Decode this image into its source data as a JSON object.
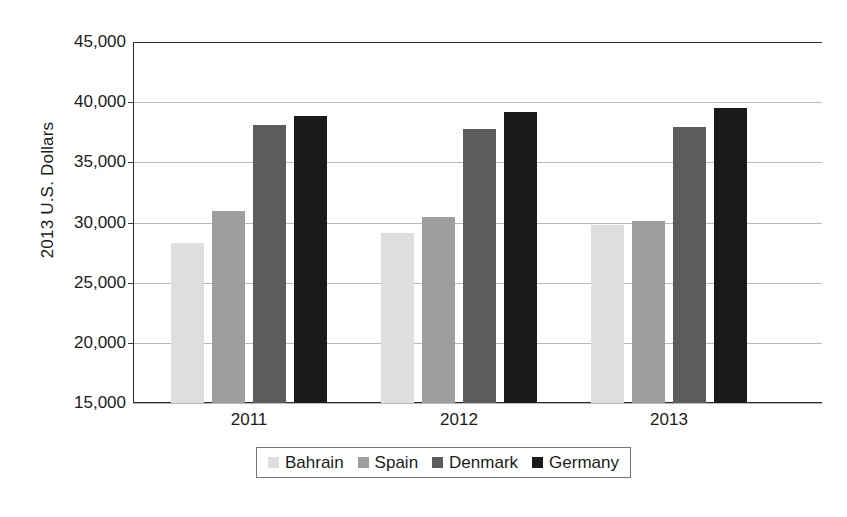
{
  "chart_data": {
    "type": "bar",
    "title": "",
    "xlabel": "",
    "ylabel": "2013 U.S. Dollars",
    "categories": [
      "2011",
      "2012",
      "2013"
    ],
    "series": [
      {
        "name": "Bahrain",
        "color": "#dedede",
        "values": [
          28300,
          29100,
          29800
        ]
      },
      {
        "name": "Spain",
        "color": "#9e9e9e",
        "values": [
          30950,
          30450,
          30100
        ]
      },
      {
        "name": "Denmark",
        "color": "#5c5c5c",
        "values": [
          38100,
          37800,
          37900
        ]
      },
      {
        "name": "Germany",
        "color": "#1a1a1a",
        "values": [
          38850,
          39200,
          39550
        ]
      }
    ],
    "ylim": [
      15000,
      45000
    ],
    "ytick_values": [
      45000,
      40000,
      35000,
      30000,
      25000,
      20000,
      15000
    ],
    "ytick_labels": [
      "45,000",
      "40,000",
      "35,000",
      "30,000",
      "25,000",
      "20,000",
      "15,000"
    ],
    "grid": true,
    "legend_position": "bottom"
  }
}
